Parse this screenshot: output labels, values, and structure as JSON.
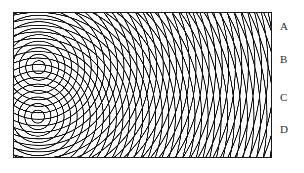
{
  "figure": {
    "kind": "two-source-wave-interference-diagram",
    "width": 304,
    "height": 173,
    "background_color": "#ffffff"
  },
  "tank": {
    "x": 13,
    "y": 12,
    "width": 259,
    "height": 146,
    "border_color": "#1a1a1a",
    "border_width": 1,
    "fill_color": "#ffffff"
  },
  "wave_field": {
    "line_color": "#111111",
    "line_width": 1.05,
    "wavelength": 6.6,
    "ring_count": 40,
    "sources": [
      {
        "name": "upper-source",
        "x": 38,
        "y": 67
      },
      {
        "name": "lower-source",
        "x": 37,
        "y": 117
      }
    ]
  },
  "labels": [
    {
      "id": "A",
      "text": "A",
      "x": 280,
      "y": 21
    },
    {
      "id": "B",
      "text": "B",
      "x": 280,
      "y": 54
    },
    {
      "id": "C",
      "text": "C",
      "x": 280,
      "y": 92
    },
    {
      "id": "D",
      "text": "D",
      "x": 280,
      "y": 124
    }
  ]
}
